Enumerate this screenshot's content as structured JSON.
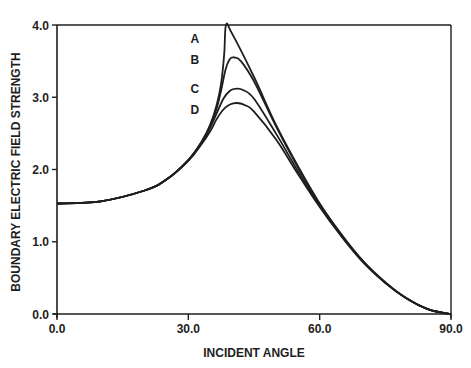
{
  "chart_data": {
    "type": "line",
    "title": "",
    "xlabel": "INCIDENT ANGLE",
    "ylabel": "BOUNDARY ELECTRIC FIELD STRENGTH",
    "xlim": [
      0,
      90
    ],
    "ylim": [
      0,
      4
    ],
    "xticks": [
      0,
      30,
      60,
      90
    ],
    "xtick_labels": [
      "0.0",
      "30.0",
      "60.0",
      "90.0"
    ],
    "yticks": [
      0,
      1,
      2,
      3,
      4
    ],
    "ytick_labels": [
      "0.0",
      "1.0",
      "2.0",
      "3.0",
      "4.0"
    ],
    "grid": false,
    "legend": "inline labels",
    "series": [
      {
        "name": "A",
        "x": [
          0,
          10,
          20,
          25,
          30,
          33,
          35,
          36.5,
          37.5,
          38.2,
          38.6,
          40,
          45,
          50,
          55,
          60,
          65,
          70,
          75,
          80,
          85,
          90
        ],
        "y": [
          1.53,
          1.56,
          1.71,
          1.86,
          2.13,
          2.38,
          2.62,
          2.9,
          3.2,
          3.6,
          4.0,
          3.88,
          3.28,
          2.62,
          2.05,
          1.53,
          1.1,
          0.73,
          0.44,
          0.21,
          0.06,
          0.0
        ]
      },
      {
        "name": "B",
        "x": [
          0,
          10,
          20,
          25,
          30,
          33,
          35,
          36.5,
          37.5,
          38.5,
          39.5,
          40.5,
          42,
          45,
          50,
          55,
          60,
          65,
          70,
          75,
          80,
          85,
          90
        ],
        "y": [
          1.53,
          1.56,
          1.71,
          1.86,
          2.13,
          2.38,
          2.6,
          2.85,
          3.1,
          3.38,
          3.53,
          3.55,
          3.5,
          3.22,
          2.6,
          2.03,
          1.52,
          1.09,
          0.72,
          0.43,
          0.21,
          0.06,
          0.0
        ]
      },
      {
        "name": "C",
        "x": [
          0,
          10,
          20,
          25,
          30,
          33,
          35,
          36.5,
          38,
          39.5,
          41,
          42.5,
          45,
          50,
          55,
          60,
          65,
          70,
          75,
          80,
          85,
          90
        ],
        "y": [
          1.53,
          1.56,
          1.71,
          1.86,
          2.13,
          2.37,
          2.58,
          2.78,
          2.98,
          3.09,
          3.12,
          3.1,
          2.98,
          2.5,
          1.98,
          1.5,
          1.08,
          0.72,
          0.43,
          0.21,
          0.06,
          0.0
        ]
      },
      {
        "name": "D",
        "x": [
          0,
          10,
          20,
          25,
          30,
          33,
          35,
          36.5,
          38,
          39.5,
          41.2,
          43,
          45,
          50,
          55,
          60,
          65,
          70,
          75,
          80,
          85,
          90
        ],
        "y": [
          1.53,
          1.56,
          1.71,
          1.86,
          2.12,
          2.35,
          2.53,
          2.7,
          2.83,
          2.9,
          2.92,
          2.89,
          2.8,
          2.42,
          1.94,
          1.48,
          1.07,
          0.71,
          0.43,
          0.21,
          0.06,
          0.0
        ]
      }
    ],
    "annotations": [
      {
        "text": "A",
        "x": 31.5,
        "y": 3.82
      },
      {
        "text": "B",
        "x": 31.5,
        "y": 3.52
      },
      {
        "text": "C",
        "x": 31.5,
        "y": 3.12
      },
      {
        "text": "D",
        "x": 31.5,
        "y": 2.83
      }
    ]
  },
  "colors": {
    "line": "#1e1e1e",
    "background": "#ffffff"
  }
}
